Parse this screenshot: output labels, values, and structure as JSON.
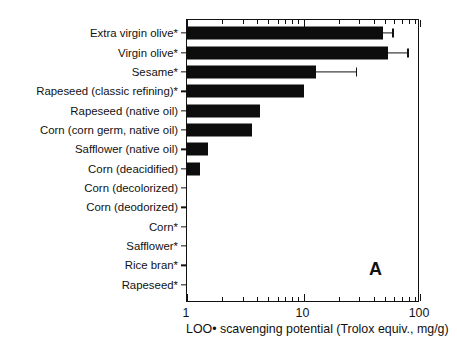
{
  "figure": {
    "panel_label": "A"
  },
  "chart_data": {
    "type": "bar",
    "orientation": "horizontal",
    "title": "",
    "xlabel": "LOO• scavenging potential (Trolox equiv., mg/g)",
    "ylabel": "",
    "xscale": "log",
    "xlim": [
      1,
      100
    ],
    "xticks": [
      1,
      10,
      100
    ],
    "xticklabels": [
      "1",
      "10",
      "100"
    ],
    "grid": false,
    "legend": null,
    "bar_color": "#0d0d0d",
    "categories": [
      "Extra virgin olive*",
      "Virgin olive*",
      "Sesame*",
      "Rapeseed (classic refining)*",
      "Rapeseed (native oil)",
      "Corn (corn germ, native oil)",
      "Safflower (native oil)",
      "Corn (deacidified)",
      "Corn (decolorized)",
      "Corn (deodorized)",
      "Corn*",
      "Safflower*",
      "Rice bran*",
      "Rapeseed*"
    ],
    "values": [
      48,
      53,
      12.8,
      10.0,
      4.2,
      3.6,
      1.5,
      1.3,
      1.0,
      1.0,
      1.0,
      1.0,
      1.0,
      1.0
    ],
    "errors_upper": [
      58,
      78,
      28,
      null,
      null,
      null,
      null,
      null,
      null,
      null,
      null,
      null,
      null,
      null
    ],
    "annotations": [
      "A"
    ]
  },
  "axis": {
    "xticklabels": [
      {
        "value": 1,
        "label": "1"
      },
      {
        "value": 10,
        "label": "10"
      },
      {
        "value": 100,
        "label": "100"
      }
    ],
    "xtitle": "LOO• scavenging potential (Trolox equiv., mg/g)"
  },
  "rows": [
    {
      "label": "Extra virgin olive*",
      "value": 48,
      "err_hi": 58
    },
    {
      "label": "Virgin olive*",
      "value": 53,
      "err_hi": 78
    },
    {
      "label": "Sesame*",
      "value": 12.8,
      "err_hi": 28
    },
    {
      "label": "Rapeseed (classic refining)*",
      "value": 10.0,
      "err_hi": null
    },
    {
      "label": "Rapeseed (native oil)",
      "value": 4.2,
      "err_hi": null
    },
    {
      "label": "Corn (corn germ, native oil)",
      "value": 3.6,
      "err_hi": null
    },
    {
      "label": "Safflower (native oil)",
      "value": 1.5,
      "err_hi": null
    },
    {
      "label": "Corn (deacidified)",
      "value": 1.3,
      "err_hi": null
    },
    {
      "label": "Corn (decolorized)",
      "value": 1.0,
      "err_hi": null
    },
    {
      "label": "Corn (deodorized)",
      "value": 1.0,
      "err_hi": null
    },
    {
      "label": "Corn*",
      "value": 1.0,
      "err_hi": null
    },
    {
      "label": "Safflower*",
      "value": 1.0,
      "err_hi": null
    },
    {
      "label": "Rice bran*",
      "value": 1.0,
      "err_hi": null
    },
    {
      "label": "Rapeseed*",
      "value": 1.0,
      "err_hi": null
    }
  ]
}
